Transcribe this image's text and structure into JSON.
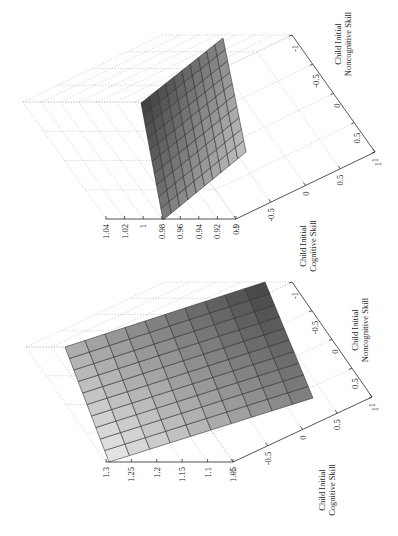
{
  "chart_data": [
    {
      "type": "surface",
      "panel": "top",
      "rotation_deg": -90,
      "title": "",
      "xlabel": "Child Initial Cognitive Skill",
      "ylabel": "Child Initial Noncognitive Skill",
      "zlabel": "",
      "x_ticks": [
        "-1",
        "-0.5",
        "0",
        "0.5",
        "1"
      ],
      "y_ticks": [
        "1",
        "0.5",
        "0",
        "-0.5",
        "-1"
      ],
      "z_ticks": [
        "1.04",
        "1.02",
        "1",
        "0.98",
        "0.96",
        "0.94",
        "0.92",
        "0.9"
      ],
      "zlim": [
        0.9,
        1.04
      ],
      "grid_size": 10,
      "z_corners": {
        "cog_-1_noncog_1": 0.98,
        "cog_-1_noncog_-1": 0.975,
        "cog_1_noncog_1": 0.92,
        "cog_1_noncog_-1": 0.93
      },
      "shading": "dark at low cognitive / low noncognitive corner, light at high cognitive high noncognitive",
      "grid": true
    },
    {
      "type": "surface",
      "panel": "bottom",
      "rotation_deg": -90,
      "title": "",
      "xlabel": "Child Initial Cognitive Skill",
      "ylabel": "Child Initial Noncognitive Skill",
      "zlabel": "",
      "x_ticks": [
        "-1",
        "-0.5",
        "0",
        "0.5",
        "1"
      ],
      "y_ticks": [
        "1",
        "0.5",
        "0",
        "-0.5",
        "-1"
      ],
      "z_ticks": [
        "1.3",
        "1.25",
        "1.2",
        "1.15",
        "1.1",
        "1.05"
      ],
      "zlim": [
        1.05,
        1.3
      ],
      "grid_size": 10,
      "z_corners": {
        "cog_-1_noncog_1": 1.3,
        "cog_-1_noncog_-1": 1.22,
        "cog_1_noncog_1": 1.12,
        "cog_1_noncog_-1": 1.06
      },
      "shading": "light at low cognitive corner, dark at high cognitive low noncognitive",
      "grid": true
    }
  ],
  "panels": {
    "top": {
      "z_ticks": [
        "1.04",
        "1.02",
        "1",
        "0.98",
        "0.96",
        "0.94",
        "0.92",
        "0.9"
      ],
      "cog_ticks": [
        "-1",
        "-0.5",
        "0",
        "0.5",
        "1"
      ],
      "noncog_ticks": [
        "1",
        "0.5",
        "0",
        "-0.5",
        "-1"
      ],
      "cog_label_1": "Child Initial",
      "cog_label_2": "Cognitive Skill",
      "noncog_label_1": "Child Initial",
      "noncog_label_2": "Noncognitive Skill"
    },
    "bottom": {
      "z_ticks": [
        "1.3",
        "1.25",
        "1.2",
        "1.15",
        "1.1",
        "1.05"
      ],
      "cog_ticks": [
        "-1",
        "-0.5",
        "0",
        "0.5",
        "1"
      ],
      "noncog_ticks": [
        "1",
        "0.5",
        "0",
        "-0.5",
        "-1"
      ],
      "cog_label_1": "Child Initial",
      "cog_label_2": "Cognitive Skill",
      "noncog_label_1": "Child Initial",
      "noncog_label_2": "Noncognitive Skill"
    }
  }
}
